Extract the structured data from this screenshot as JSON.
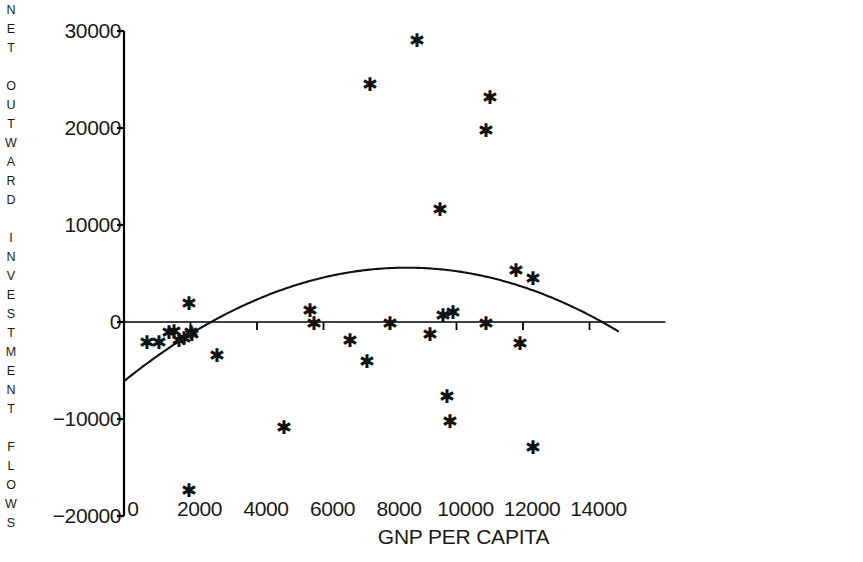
{
  "chart_data": {
    "type": "scatter",
    "title": "",
    "xlabel": "GNP PER CAPITA",
    "ylabel": "NET OUTWARD INVESTMENT FLOWS",
    "xlim": [
      0,
      14900
    ],
    "ylim": [
      -20000,
      30000
    ],
    "xticks": [
      0,
      2000,
      4000,
      6000,
      8000,
      10000,
      12000,
      14000
    ],
    "xtick_labels": [
      "0",
      "2000",
      "4000",
      "6000",
      "8000",
      "10000",
      "12000",
      "14000"
    ],
    "yticks": [
      -20000,
      -10000,
      0,
      10000,
      20000,
      30000
    ],
    "ytick_labels": [
      "-20000",
      "-10000",
      "0",
      "10000",
      "20000",
      "30000"
    ],
    "grid": false,
    "legend": null,
    "marker": "asterisk",
    "marker_color": "#111111",
    "axis_color": "#000000",
    "background": "#ffffff",
    "zero_line": true,
    "points": [
      {
        "x": 700,
        "y": -2100
      },
      {
        "x": 1050,
        "y": -2100
      },
      {
        "x": 1350,
        "y": -1000
      },
      {
        "x": 1500,
        "y": -900
      },
      {
        "x": 1640,
        "y": -1900
      },
      {
        "x": 1800,
        "y": -1700
      },
      {
        "x": 1950,
        "y": -17300
      },
      {
        "x": 1960,
        "y": 2000
      },
      {
        "x": 2000,
        "y": -1000
      },
      {
        "x": 2050,
        "y": -1250
      },
      {
        "x": 2800,
        "y": -3400
      },
      {
        "x": 4800,
        "y": -10800
      },
      {
        "x": 5600,
        "y": 1200
      },
      {
        "x": 5700,
        "y": -100
      },
      {
        "x": 6800,
        "y": -1900
      },
      {
        "x": 7300,
        "y": -4000
      },
      {
        "x": 7400,
        "y": 24500
      },
      {
        "x": 8000,
        "y": -100
      },
      {
        "x": 8800,
        "y": 29100
      },
      {
        "x": 9200,
        "y": -1200
      },
      {
        "x": 9500,
        "y": 11700
      },
      {
        "x": 9600,
        "y": 700
      },
      {
        "x": 9700,
        "y": -7600
      },
      {
        "x": 9800,
        "y": -10200
      },
      {
        "x": 9900,
        "y": 1000
      },
      {
        "x": 10900,
        "y": -100
      },
      {
        "x": 10900,
        "y": 19800
      },
      {
        "x": 11000,
        "y": 23200
      },
      {
        "x": 11800,
        "y": 5400
      },
      {
        "x": 11900,
        "y": -2200
      },
      {
        "x": 12300,
        "y": 4500
      },
      {
        "x": 12300,
        "y": -12900
      }
    ],
    "fitted_curve": {
      "name": "quadratic fit",
      "description": "inverted-U regression curve",
      "y_at_x0": -6100,
      "peak_x": 8500,
      "peak_y": 5600,
      "zero_crossings": [
        2800,
        14800
      ]
    }
  },
  "axes": {
    "y_title_letters": [
      "N",
      "E",
      "T",
      "",
      "O",
      "U",
      "T",
      "W",
      "A",
      "R",
      "D",
      "",
      "I",
      "N",
      "V",
      "E",
      "S",
      "T",
      "M",
      "E",
      "N",
      "T",
      "",
      "F",
      "L",
      "O",
      "W",
      "S"
    ]
  }
}
